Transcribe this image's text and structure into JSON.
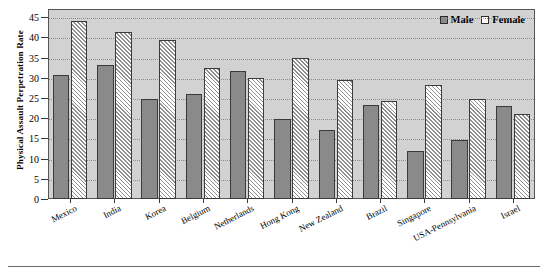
{
  "chart_data": {
    "type": "bar",
    "title": "",
    "subtitle": "",
    "xlabel": "",
    "ylabel": "Physical Assault Perpetration Rate",
    "ylim": [
      0,
      47
    ],
    "yticks": [
      0,
      5,
      10,
      15,
      20,
      25,
      30,
      35,
      40,
      45
    ],
    "grid": true,
    "grid_style": "dotted horizontal",
    "legend_position": "top-right",
    "categories": [
      "Mexico",
      "India",
      "Korea",
      "Belgium",
      "Netherlands",
      "Hong Kong",
      "New Zealand",
      "Brazil",
      "Singapore",
      "USA-Pennsylvania",
      "Israel"
    ],
    "series": [
      {
        "name": "Male",
        "color": "#8a8a8a",
        "fill": "solid",
        "values": [
          30.8,
          33.2,
          24.7,
          26.0,
          31.6,
          19.9,
          17.0,
          23.2,
          12.0,
          14.7,
          23.0
        ]
      },
      {
        "name": "Female",
        "color": "#ffffff",
        "fill": "diagonal-hatch",
        "values": [
          44.0,
          41.2,
          39.4,
          32.5,
          29.9,
          34.8,
          29.5,
          24.2,
          28.2,
          24.8,
          21.1
        ]
      }
    ]
  },
  "legend": {
    "items": [
      {
        "label": "Male",
        "swatch": "solid-gray-square-icon"
      },
      {
        "label": "Female",
        "swatch": "hatched-white-square-icon"
      }
    ]
  },
  "colors": {
    "plot_background": "#d2d2d2",
    "page_background": "#ffffff",
    "axis": "#3a3a3a",
    "gridline": "#8d8d8d",
    "male_bar": "#8a8a8a",
    "female_bar": "#ffffff",
    "bar_border": "#3b3b3b",
    "text": "#000000"
  }
}
